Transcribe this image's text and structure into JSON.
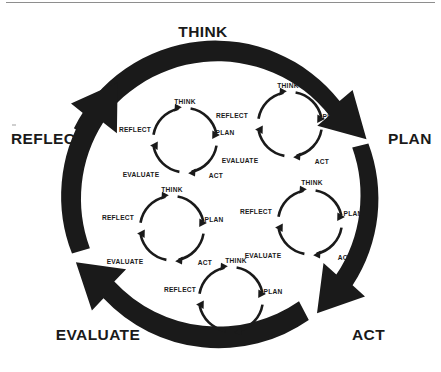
{
  "diagram": {
    "title_text_visible": false,
    "type": "nested-cyclical-process-diagram",
    "colors": {
      "ink": "#1a1a1a",
      "background": "#ffffff",
      "rule": "#8e8e8e"
    },
    "outer_cycle": {
      "direction": "clockwise",
      "steps": [
        {
          "key": "think",
          "label": "THINK"
        },
        {
          "key": "plan",
          "label": "PLAN"
        },
        {
          "key": "act",
          "label": "ACT"
        },
        {
          "key": "evaluate",
          "label": "EVALUATE"
        },
        {
          "key": "reflect",
          "label": "REFLECT"
        }
      ]
    },
    "inner_cycles": [
      {
        "id": "cycle-top-left",
        "labels": {
          "think": "THINK",
          "plan": "PLAN",
          "act": "ACT",
          "evaluate": "EVALUATE",
          "reflect": "REFLECT"
        }
      },
      {
        "id": "cycle-top-right",
        "labels": {
          "think": "THINK",
          "plan": "PLAN",
          "act": "ACT",
          "evaluate": "EVALUATE",
          "reflect": "REFLECT"
        }
      },
      {
        "id": "cycle-middle-left",
        "labels": {
          "think": "THINK",
          "plan": "PLAN",
          "act": "ACT",
          "evaluate": "EVALUATE",
          "reflect": "REFLECT"
        }
      },
      {
        "id": "cycle-middle-right",
        "labels": {
          "think": "THINK",
          "plan": "PLAN",
          "act": "ACT",
          "evaluate": "EVALUATE",
          "reflect": "REFLECT"
        }
      },
      {
        "id": "cycle-bottom",
        "labels": {
          "think": "THINK",
          "plan": "PLAN",
          "act": "ACT",
          "evaluate": "EVALUATE",
          "reflect": "REFLECT"
        }
      }
    ]
  }
}
